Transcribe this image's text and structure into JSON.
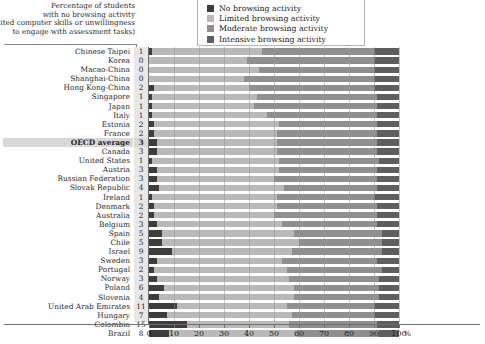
{
  "caption": {
    "lines": [
      "Percentage of students",
      "with no browsing activity",
      "(limited computer skills or unwillingness",
      "to engage with assessment tasks)"
    ]
  },
  "legend": {
    "items": [
      {
        "label": "No browsing activity",
        "color": "#3d3d3d"
      },
      {
        "label": "Limited browsing activity",
        "color": "#b9b9b9"
      },
      {
        "label": "Moderate browsing activity",
        "color": "#8f8f8f"
      },
      {
        "label": "Intensive browsing activity",
        "color": "#5e5e5e"
      }
    ]
  },
  "axis": {
    "ticks": [
      0,
      10,
      20,
      30,
      40,
      50,
      60,
      70,
      80,
      90,
      100
    ],
    "unit": "%",
    "min": 0,
    "max": 100
  },
  "highlight_row": "OECD average",
  "chart_data": {
    "type": "bar",
    "orientation": "horizontal",
    "stacked": true,
    "title": "Percentage of students with no browsing activity (limited computer skills or unwillingness to engage with assessment tasks)",
    "xlabel": "%",
    "ylabel": "",
    "xlim": [
      0,
      100
    ],
    "grid": true,
    "legend_position": "top-right",
    "series": [
      {
        "name": "No browsing activity",
        "color": "#3d3d3d",
        "values": [
          1,
          0,
          0,
          0,
          2,
          1,
          1,
          1,
          2,
          2,
          3,
          3,
          1,
          3,
          3,
          4,
          1,
          2,
          2,
          3,
          5,
          5,
          9,
          3,
          2,
          3,
          6,
          4,
          11,
          7,
          15,
          8
        ]
      },
      {
        "name": "Limited browsing activity",
        "color": "#b9b9b9",
        "values": [
          44,
          39,
          44,
          38,
          38,
          42,
          41,
          46,
          50,
          49,
          48,
          48,
          51,
          49,
          47,
          50,
          50,
          49,
          48,
          50,
          53,
          55,
          48,
          50,
          53,
          53,
          52,
          54,
          44,
          50,
          41,
          51
        ]
      },
      {
        "name": "Moderate browsing activity",
        "color": "#8f8f8f",
        "values": [
          45,
          51,
          46,
          52,
          50,
          48,
          49,
          44,
          39,
          40,
          40,
          40,
          40,
          39,
          41,
          37,
          39,
          40,
          41,
          38,
          35,
          33,
          36,
          38,
          38,
          36,
          34,
          34,
          35,
          33,
          35,
          33
        ]
      },
      {
        "name": "Intensive browsing activity",
        "color": "#5e5e5e",
        "values": [
          10,
          10,
          10,
          10,
          10,
          9,
          9,
          9,
          9,
          9,
          9,
          9,
          8,
          9,
          9,
          9,
          10,
          9,
          9,
          9,
          7,
          7,
          7,
          9,
          7,
          8,
          8,
          8,
          10,
          10,
          9,
          8
        ]
      }
    ],
    "categories": [
      "Chinese Taipei",
      "Korea",
      "Macao-China",
      "Shanghai-China",
      "Hong Kong-China",
      "Singapore",
      "Japan",
      "Italy",
      "Estonia",
      "France",
      "OECD average",
      "Canada",
      "United States",
      "Austria",
      "Russian Federation",
      "Slovak Republic",
      "Ireland",
      "Denmark",
      "Australia",
      "Belgium",
      "Spain",
      "Chile",
      "Israel",
      "Sweden",
      "Portugal",
      "Norway",
      "Poland",
      "Slovenia",
      "United Arab Emirates",
      "Hungary",
      "Colombia",
      "Brazil"
    ],
    "no_browsing_labels": [
      "1",
      "0",
      "0",
      "0",
      "2",
      "1",
      "1",
      "1",
      "2",
      "2",
      "3",
      "3",
      "1",
      "3",
      "3",
      "4",
      "1",
      "2",
      "2",
      "3",
      "5",
      "5",
      "9",
      "3",
      "2",
      "3",
      "6",
      "4",
      "11",
      "7",
      "15",
      "8"
    ]
  }
}
